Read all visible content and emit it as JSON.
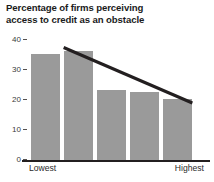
{
  "chart_data": {
    "type": "bar",
    "title": "Percentage of firms perceiving access to credit as an obstacle",
    "title_lines": [
      "Percentage of firms perceiving",
      "access to credit as an obstacle"
    ],
    "xlabel": "",
    "ylabel": "",
    "categories": [
      "Lowest",
      "",
      "",
      "",
      "Highest"
    ],
    "category_labels_shown": [
      "Lowest",
      "Highest"
    ],
    "values": [
      35.2,
      36.2,
      23.5,
      22.7,
      20.5
    ],
    "series": [
      {
        "name": "Percentage of firms perceiving access to credit as an obstacle",
        "values": [
          35.2,
          36.2,
          23.5,
          22.7,
          20.5
        ],
        "color": "#9a9a9a"
      }
    ],
    "ylim": [
      0,
      40
    ],
    "yticks": [
      0,
      10,
      20,
      30,
      40
    ],
    "ytick_labels": [
      "0",
      "10",
      "20",
      "30",
      "40"
    ],
    "grid": false,
    "legend": false,
    "legend_position": "none",
    "annotations": [
      {
        "type": "trendline",
        "name": "downward-trend-line",
        "x_start_index": 0.55,
        "y_start": 37.5,
        "x_end_index": 4.45,
        "y_end": 19.0,
        "color": "#231f20",
        "width_px": 3
      }
    ],
    "colors": {
      "bar": "#9a9a9a",
      "trendline": "#231f20",
      "axis": "#231f20",
      "tick": "#55514f",
      "text": "#221f1f",
      "background": "#ffffff"
    }
  }
}
